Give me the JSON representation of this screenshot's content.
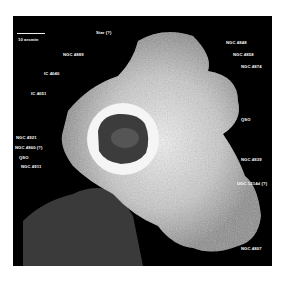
{
  "figure": {
    "scale_bar": {
      "label": "10 arcmin"
    },
    "labels": [
      {
        "id": "star",
        "text": "Star (?)",
        "x": 83,
        "y": 14
      },
      {
        "id": "ngc4889",
        "text": "NGC 4889",
        "x": 50,
        "y": 36
      },
      {
        "id": "ic4040",
        "text": "IC 4040",
        "x": 31,
        "y": 55
      },
      {
        "id": "ic4051",
        "text": "IC 4051",
        "x": 18,
        "y": 75
      },
      {
        "id": "ngc4848",
        "text": "NGC 4848",
        "x": 213,
        "y": 24
      },
      {
        "id": "ngc4858",
        "text": "NGC 4858",
        "x": 220,
        "y": 36
      },
      {
        "id": "ngc4874",
        "text": "NGC 4874",
        "x": 228,
        "y": 48
      },
      {
        "id": "qso1",
        "text": "QSO",
        "x": 228,
        "y": 101
      },
      {
        "id": "ngc4921",
        "text": "NGC 4921",
        "x": 3,
        "y": 119
      },
      {
        "id": "ngc4860",
        "text": "NGC 4860 (?)",
        "x": 2,
        "y": 129
      },
      {
        "id": "qso2",
        "text": "QSO",
        "x": 6,
        "y": 139
      },
      {
        "id": "ngc4911",
        "text": "NGC 4911",
        "x": 8,
        "y": 148
      },
      {
        "id": "ngc4839",
        "text": "NGC 4839",
        "x": 228,
        "y": 141
      },
      {
        "id": "ugc",
        "text": "UGC 1214d (?)",
        "x": 224,
        "y": 165
      },
      {
        "id": "ngc4807",
        "text": "NGC 4807",
        "x": 228,
        "y": 230
      }
    ]
  }
}
